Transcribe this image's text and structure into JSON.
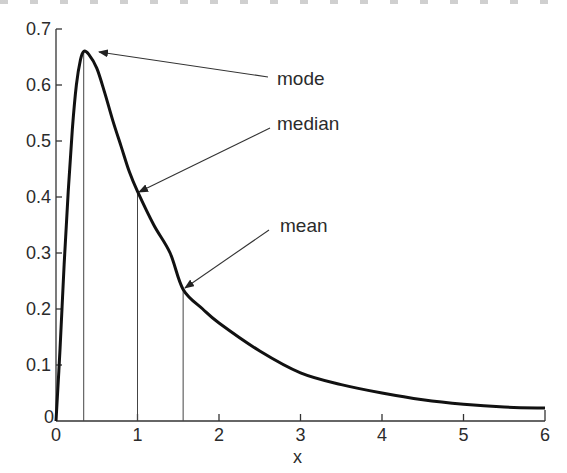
{
  "chart_data": {
    "type": "line",
    "title": "",
    "xlabel": "x",
    "ylabel": "",
    "xlim": [
      0,
      6
    ],
    "ylim": [
      0,
      0.7
    ],
    "grid": false,
    "legend": null,
    "x_ticks": [
      0,
      1,
      2,
      3,
      4,
      5,
      6
    ],
    "x_tick_labels": [
      "0",
      "1",
      "2",
      "3",
      "4",
      "5",
      "6"
    ],
    "y_ticks": [
      0,
      0.1,
      0.2,
      0.3,
      0.4,
      0.5,
      0.6,
      0.7
    ],
    "y_tick_labels": [
      "0",
      "0.1",
      "0.2",
      "0.3",
      "0.4",
      "0.5",
      "0.6",
      "0.7"
    ],
    "series": [
      {
        "name": "density",
        "x": [
          0,
          0.05,
          0.1,
          0.15,
          0.2,
          0.25,
          0.3,
          0.34,
          0.4,
          0.5,
          0.6,
          0.7,
          0.8,
          0.9,
          1.0,
          1.2,
          1.4,
          1.56,
          1.8,
          2.0,
          2.5,
          3.0,
          3.5,
          4.0,
          4.5,
          5.0,
          5.5,
          6.0
        ],
        "values": [
          0,
          0.13,
          0.28,
          0.41,
          0.52,
          0.6,
          0.645,
          0.66,
          0.655,
          0.63,
          0.585,
          0.535,
          0.49,
          0.445,
          0.41,
          0.35,
          0.3,
          0.235,
          0.2,
          0.175,
          0.125,
          0.086,
          0.065,
          0.05,
          0.038,
          0.03,
          0.025,
          0.023
        ]
      }
    ],
    "annotations": [
      {
        "label": "mode",
        "x": 0.34,
        "y": 0.66
      },
      {
        "label": "median",
        "x": 1.0,
        "y": 0.41
      },
      {
        "label": "mean",
        "x": 1.56,
        "y": 0.235
      }
    ]
  },
  "labels": {
    "xlabel": "x",
    "mode": "mode",
    "median": "median",
    "mean": "mean"
  }
}
